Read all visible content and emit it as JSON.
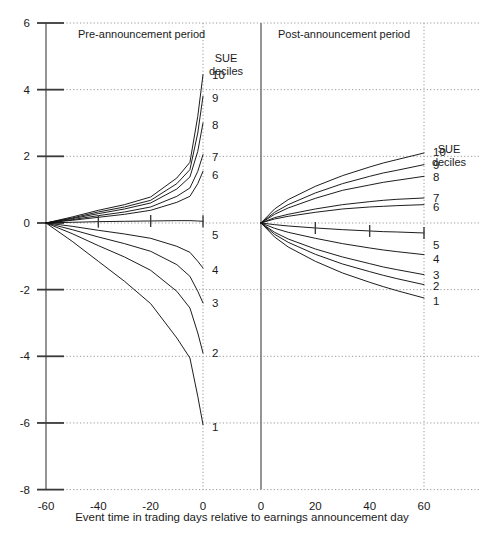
{
  "chart_data": {
    "type": "line",
    "title": "",
    "xlabel": "Event time in trading days relative to earnings announcement day",
    "ylabel": "",
    "grid": "dotted",
    "legend_position": "right-of-each-panel",
    "ylim": [
      -8,
      6
    ],
    "ytick_labels": [
      "6",
      "4",
      "2",
      "0",
      "-2",
      "-4",
      "-6",
      "-8"
    ],
    "ytick_values": [
      6,
      4,
      2,
      0,
      -2,
      -4,
      -6,
      -8
    ],
    "panels": [
      {
        "name": "pre-announcement",
        "label": "Pre-announcement period",
        "legend_title_line1": "SUE",
        "legend_title_line2": "deciles",
        "xlim": [
          -60,
          0
        ],
        "xtick_labels": [
          "-60",
          "-40",
          "-20",
          "0"
        ],
        "xtick_values": [
          -60,
          -40,
          -20,
          0
        ],
        "x": [
          -60,
          -50,
          -40,
          -30,
          -20,
          -10,
          -5,
          -2,
          0
        ],
        "series": [
          {
            "name": "10",
            "label": "10",
            "values": [
              0.0,
              0.18,
              0.38,
              0.55,
              0.78,
              1.35,
              1.82,
              3.2,
              4.45
            ]
          },
          {
            "name": "9",
            "label": "9",
            "values": [
              0.0,
              0.15,
              0.33,
              0.48,
              0.68,
              1.18,
              1.6,
              2.7,
              3.8
            ]
          },
          {
            "name": "8",
            "label": "8",
            "values": [
              0.0,
              0.13,
              0.28,
              0.42,
              0.6,
              1.02,
              1.38,
              2.15,
              3.0
            ]
          },
          {
            "name": "7",
            "label": "7",
            "values": [
              0.0,
              0.1,
              0.22,
              0.33,
              0.48,
              0.8,
              1.05,
              1.55,
              2.05
            ]
          },
          {
            "name": "6",
            "label": "6",
            "values": [
              0.0,
              0.08,
              0.17,
              0.26,
              0.38,
              0.62,
              0.8,
              1.18,
              1.55
            ]
          },
          {
            "name": "5",
            "label": "5",
            "values": [
              0.0,
              0.02,
              0.04,
              0.05,
              0.06,
              0.07,
              0.07,
              0.06,
              0.05
            ]
          },
          {
            "name": "4",
            "label": "4",
            "values": [
              0.0,
              -0.1,
              -0.22,
              -0.33,
              -0.46,
              -0.7,
              -0.88,
              -1.15,
              -1.35
            ]
          },
          {
            "name": "3",
            "label": "3",
            "values": [
              0.0,
              -0.2,
              -0.42,
              -0.62,
              -0.85,
              -1.25,
              -1.6,
              -2.05,
              -2.4
            ]
          },
          {
            "name": "2",
            "label": "2",
            "values": [
              0.0,
              -0.32,
              -0.68,
              -1.02,
              -1.42,
              -2.05,
              -2.55,
              -3.3,
              -3.9
            ]
          },
          {
            "name": "1",
            "label": "1",
            "values": [
              0.0,
              -0.55,
              -1.15,
              -1.75,
              -2.42,
              -3.45,
              -4.05,
              -5.2,
              -6.05
            ]
          }
        ],
        "hash_marks_on_series": "5",
        "hash_mark_x": [
          -40,
          -20,
          0
        ]
      },
      {
        "name": "post-announcement",
        "label": "Post-announcement period",
        "legend_title_line1": "SUE",
        "legend_title_line2": "deciles",
        "xlim": [
          0,
          60
        ],
        "xtick_labels": [
          "0",
          "20",
          "40",
          "60"
        ],
        "xtick_values": [
          0,
          20,
          40,
          60
        ],
        "x": [
          0,
          5,
          10,
          20,
          30,
          40,
          45,
          50,
          60
        ],
        "series": [
          {
            "name": "10",
            "label": "10",
            "values": [
              0.0,
              0.42,
              0.7,
              1.1,
              1.42,
              1.68,
              1.8,
              1.9,
              2.1
            ]
          },
          {
            "name": "9",
            "label": "9",
            "values": [
              0.0,
              0.32,
              0.55,
              0.9,
              1.18,
              1.4,
              1.5,
              1.58,
              1.75
            ]
          },
          {
            "name": "8",
            "label": "8",
            "values": [
              0.0,
              0.26,
              0.45,
              0.74,
              0.98,
              1.14,
              1.22,
              1.28,
              1.4
            ]
          },
          {
            "name": "7",
            "label": "7",
            "values": [
              0.0,
              0.16,
              0.26,
              0.42,
              0.55,
              0.64,
              0.68,
              0.71,
              0.75
            ]
          },
          {
            "name": "6",
            "label": "6",
            "values": [
              0.0,
              0.12,
              0.2,
              0.32,
              0.42,
              0.48,
              0.5,
              0.52,
              0.55
            ]
          },
          {
            "name": "5",
            "label": "5",
            "values": [
              0.0,
              -0.05,
              -0.09,
              -0.15,
              -0.2,
              -0.24,
              -0.26,
              -0.27,
              -0.3
            ]
          },
          {
            "name": "4",
            "label": "4",
            "values": [
              0.0,
              -0.16,
              -0.28,
              -0.46,
              -0.62,
              -0.75,
              -0.81,
              -0.86,
              -0.95
            ]
          },
          {
            "name": "3",
            "label": "3",
            "values": [
              0.0,
              -0.28,
              -0.48,
              -0.78,
              -1.02,
              -1.22,
              -1.32,
              -1.4,
              -1.55
            ]
          },
          {
            "name": "2",
            "label": "2",
            "values": [
              0.0,
              -0.34,
              -0.58,
              -0.94,
              -1.23,
              -1.46,
              -1.57,
              -1.67,
              -1.85
            ]
          },
          {
            "name": "1",
            "label": "1",
            "values": [
              0.0,
              -0.42,
              -0.72,
              -1.15,
              -1.5,
              -1.78,
              -1.91,
              -2.03,
              -2.25
            ]
          }
        ],
        "hash_marks_on_series": "5",
        "hash_mark_x": [
          20,
          40,
          60
        ]
      }
    ]
  },
  "axes": {
    "x_caption": "Event time in trading days relative to earnings announcement day"
  },
  "colors": {
    "line": "#111111",
    "grid": "#9a9a9a",
    "axis": "#7a7a7a",
    "text": "#1a1a1a"
  }
}
